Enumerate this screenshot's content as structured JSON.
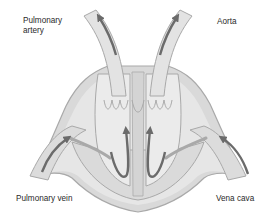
{
  "diagram": {
    "labels": {
      "pulmonary_artery": "Pulmonary artery",
      "aorta": "Aorta",
      "pulmonary_vein": "Pulmonary vein",
      "vena_cava": "Vena cava"
    },
    "colors": {
      "background": "#ffffff",
      "tissue_fill": "#d9d9d9",
      "chamber_fill": "#e9e9e9",
      "wall_stroke": "#a9a9a9",
      "arrow": "#6b6b6b",
      "text": "#2a2a2a"
    },
    "arrows": [
      {
        "name": "pulmonary-artery-outflow",
        "direction": "up-left"
      },
      {
        "name": "aorta-outflow",
        "direction": "up-right"
      },
      {
        "name": "pulmonary-vein-inflow",
        "direction": "up-right"
      },
      {
        "name": "vena-cava-inflow",
        "direction": "up-left"
      },
      {
        "name": "left-ventricle-flow",
        "direction": "up"
      },
      {
        "name": "right-ventricle-flow",
        "direction": "up"
      }
    ]
  }
}
